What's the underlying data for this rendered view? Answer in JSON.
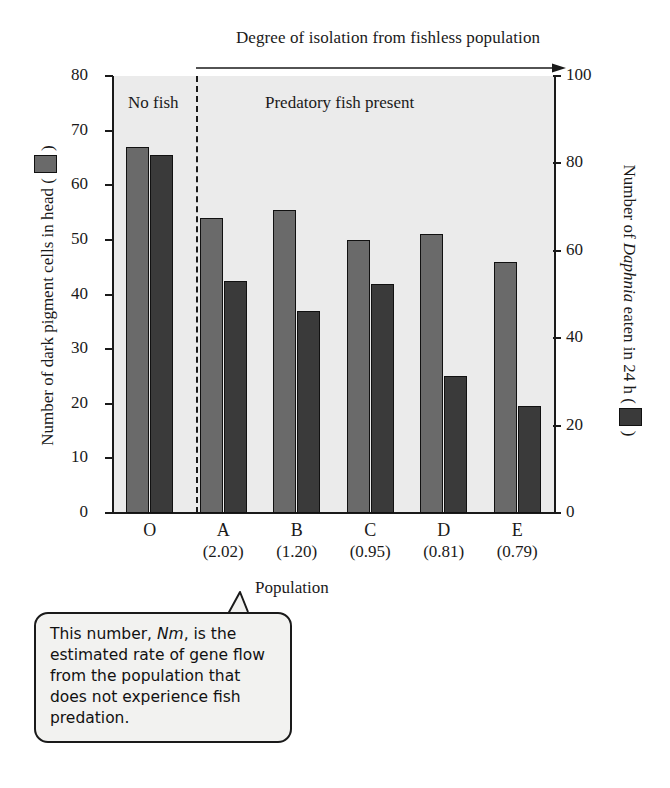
{
  "top_annotation": "Degree of isolation from fishless population",
  "regions": {
    "left": "No fish",
    "right": "Predatory fish present"
  },
  "axes": {
    "left_title_pre": "Number of dark pigment cells in head (",
    "left_title_post": ")",
    "right_title_pre": "Number of ",
    "right_title_italic": "Daphnia",
    "right_title_mid": " eaten in 24 h (",
    "right_title_post": ")",
    "x_title": "Population",
    "left_ticks": [
      0,
      10,
      20,
      30,
      40,
      50,
      60,
      70,
      80
    ],
    "right_ticks": [
      0,
      20,
      40,
      60,
      80,
      100
    ]
  },
  "callout": {
    "line1_a": "This number, ",
    "line1_italic": "Nm",
    "line1_b": ", is the estimated rate of gene flow from the population that does not experience fish predation."
  },
  "colors": {
    "pigment_bar": "#6a6a6a",
    "daphnia_bar": "#3a3a3a",
    "plot_background": "#ebebeb",
    "axis": "#1a1a1a"
  },
  "chart_data": {
    "type": "bar",
    "title": "Degree of isolation from fishless population",
    "xlabel": "Population",
    "categories": [
      "O",
      "A",
      "B",
      "C",
      "D",
      "E"
    ],
    "nm_values": [
      "",
      "(2.02)",
      "(1.20)",
      "(0.95)",
      "(0.81)",
      "(0.79)"
    ],
    "series": [
      {
        "name": "Number of dark pigment cells in head",
        "axis": "left",
        "color": "#6a6a6a",
        "values": [
          67,
          54,
          55.5,
          50,
          51,
          46
        ]
      },
      {
        "name": "Number of Daphnia eaten in 24 h",
        "axis": "right",
        "color": "#3a3a3a",
        "values_left_scale": [
          65.5,
          42.5,
          37,
          42,
          25,
          19.5
        ],
        "values": [
          82,
          53,
          46,
          53,
          31,
          24
        ]
      }
    ],
    "ylabel": "Number of dark pigment cells in head",
    "ylabel_right": "Number of Daphnia eaten in 24 h",
    "ylim": [
      0,
      80
    ],
    "ylim_right": [
      0,
      100
    ],
    "grid": false,
    "legend": "inline-axis-swatches",
    "annotations": [
      {
        "text": "No fish",
        "region": "left-of-divider"
      },
      {
        "text": "Predatory fish present",
        "region": "right-of-divider"
      },
      {
        "text": "This number, Nm, is the estimated rate of gene flow from the population that does not experience fish predation.",
        "points_to": "(2.02)"
      }
    ]
  }
}
